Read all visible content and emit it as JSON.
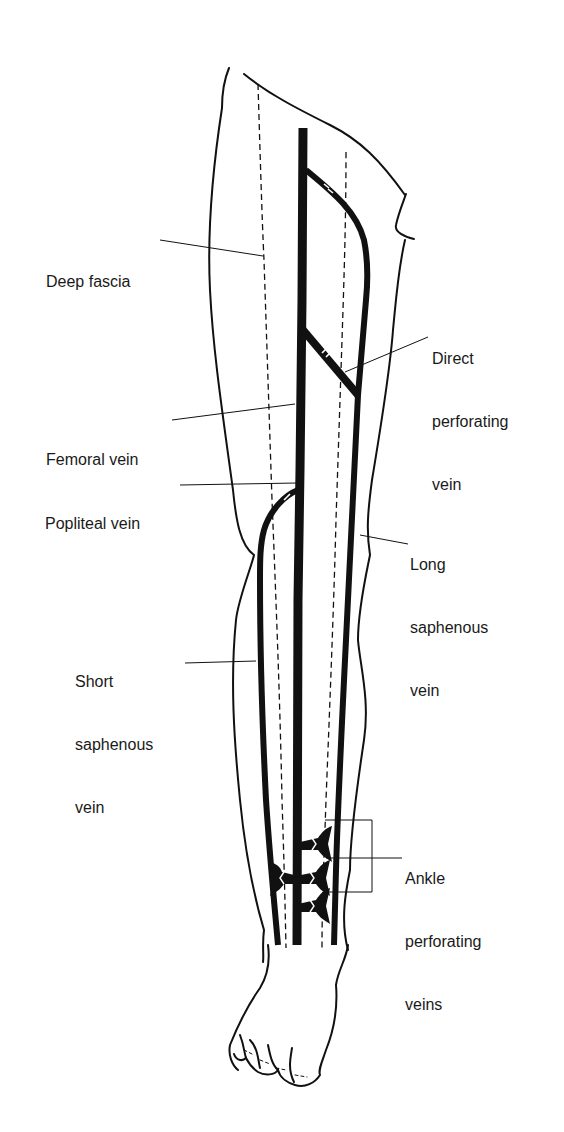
{
  "diagram": {
    "colors": {
      "ink": "#111111",
      "background": "#ffffff"
    },
    "labels": {
      "deep_fascia": {
        "lines": [
          "Deep fascia"
        ]
      },
      "direct_perforating_vein": {
        "lines": [
          "Direct",
          "perforating",
          "vein"
        ]
      },
      "femoral_vein": {
        "lines": [
          "Femoral vein"
        ]
      },
      "popliteal_vein": {
        "lines": [
          "Popliteal vein"
        ]
      },
      "long_saphenous_vein": {
        "lines": [
          "Long",
          "saphenous",
          "vein"
        ]
      },
      "short_saphenous_vein": {
        "lines": [
          "Short",
          "saphenous",
          "vein"
        ]
      },
      "ankle_perforating_veins": {
        "lines": [
          "Ankle",
          "perforating",
          "veins"
        ]
      }
    },
    "structures": [
      "leg-outline",
      "foot-outline",
      "deep-fascia-dashed-lines",
      "femoral-vein",
      "popliteal-vein",
      "long-saphenous-vein",
      "short-saphenous-vein",
      "direct-perforating-vein",
      "ankle-perforating-veins",
      "valves"
    ]
  }
}
